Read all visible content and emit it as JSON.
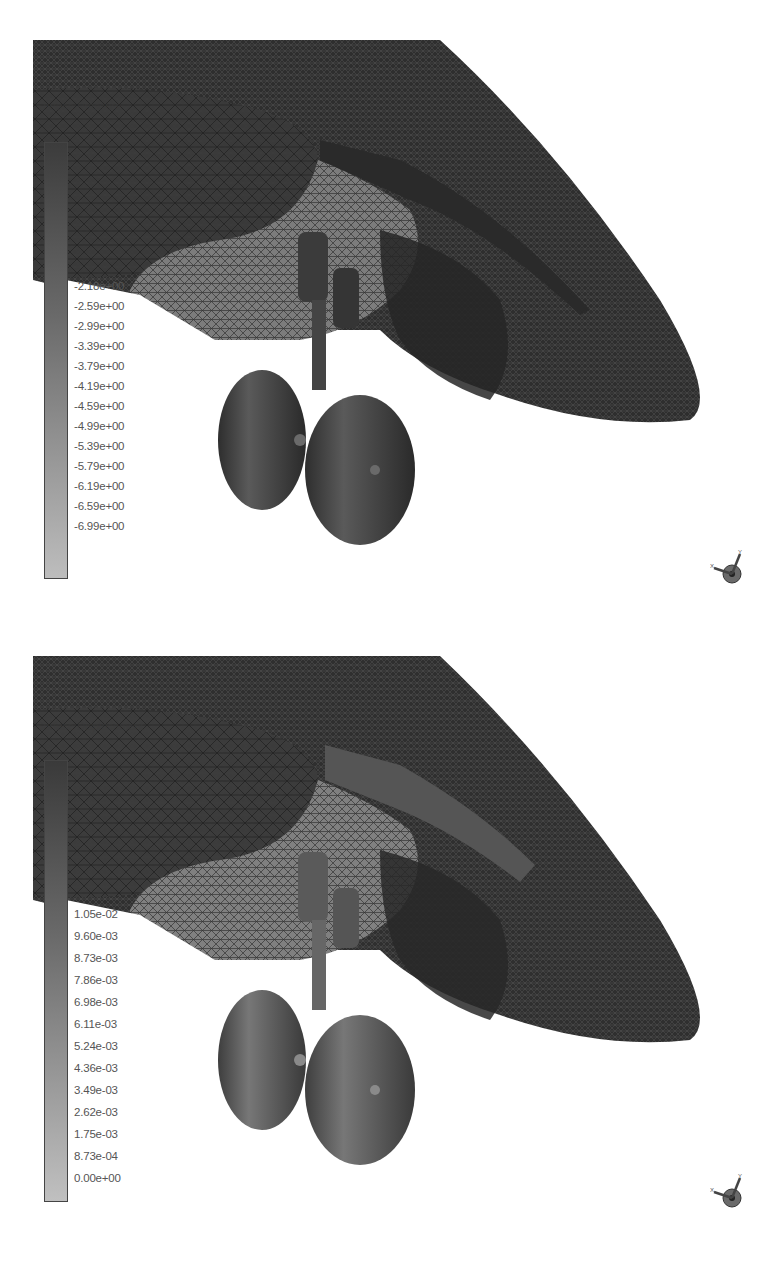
{
  "panels": [
    {
      "id": "pressure",
      "legend": {
        "title": "Surface Pressure",
        "labels_top_hidden": [
          "-0.18e+00",
          "-0.58e+00",
          "-0.98e+00",
          "-1.38e+00",
          "-1.78e+00"
        ],
        "labels": [
          "-2.18e+00",
          "-2.59e+00",
          "-2.99e+00",
          "-3.39e+00",
          "-3.79e+00",
          "-4.19e+00",
          "-4.59e+00",
          "-4.99e+00",
          "-5.39e+00",
          "-5.79e+00",
          "-6.19e+00",
          "-6.59e+00",
          "-6.99e+00"
        ],
        "bar_color_top": "#4a4a4a",
        "bar_color_bottom": "#bdbdbd"
      },
      "triad_icon": "axis-triad-icon"
    },
    {
      "id": "displacement",
      "legend": {
        "title": "Surface Displacement",
        "labels": [
          "1.05e-02",
          "9.60e-03",
          "8.73e-03",
          "7.86e-03",
          "6.98e-03",
          "6.11e-03",
          "5.24e-03",
          "4.36e-03",
          "3.49e-03",
          "2.62e-03",
          "1.75e-03",
          "8.73e-04",
          "0.00e+00"
        ],
        "bar_color_top": "#3e3e3e",
        "bar_color_bottom": "#bfbfbf"
      },
      "triad_icon": "axis-triad-icon"
    }
  ],
  "colors": {
    "mesh_dark": "#2b2b2b",
    "mesh_mid": "#3d3d3d",
    "mesh_light": "#8a8a8a",
    "gear_dark": "#3a3a3a",
    "gear_mid": "#5c5c5c",
    "background": "#ffffff"
  }
}
